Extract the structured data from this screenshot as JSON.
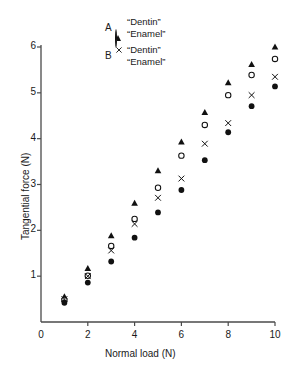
{
  "chart_data": {
    "type": "scatter",
    "title": "",
    "xlabel": "Normal load (N)",
    "ylabel": "Tangential force (N)",
    "xlim": [
      0,
      10
    ],
    "ylim": [
      0,
      6
    ],
    "xticks": [
      0,
      2,
      4,
      6,
      8,
      10
    ],
    "yticks": [
      1,
      2,
      3,
      4,
      5,
      6
    ],
    "grid": false,
    "legend_position": "top-center",
    "x": [
      1,
      2,
      3,
      4,
      5,
      6,
      7,
      8,
      9,
      10
    ],
    "series": [
      {
        "name": "A “Dentin”",
        "group": "A",
        "material": "“Dentin”",
        "marker": "filled-triangle",
        "color": "#111111",
        "values": [
          0.55,
          1.17,
          1.88,
          2.59,
          3.3,
          3.93,
          4.57,
          5.22,
          5.62,
          6.0
        ]
      },
      {
        "name": "A “Enamel”",
        "group": "A",
        "material": "“Enamel”",
        "marker": "open-circle",
        "color": "#111111",
        "values": [
          0.48,
          1.01,
          1.66,
          2.25,
          2.93,
          3.63,
          4.3,
          4.95,
          5.39,
          5.74
        ]
      },
      {
        "name": "B “Dentin”",
        "group": "B",
        "material": "“Dentin”",
        "marker": "cross-x",
        "color": "#111111",
        "values": [
          0.5,
          1.0,
          1.56,
          2.14,
          2.71,
          3.13,
          3.89,
          4.34,
          4.95,
          5.35
        ]
      },
      {
        "name": "B “Enamel”",
        "group": "B",
        "material": "“Enamel”",
        "marker": "filled-circle",
        "color": "#111111",
        "values": [
          0.42,
          0.86,
          1.32,
          1.84,
          2.39,
          2.88,
          3.53,
          4.14,
          4.71,
          5.14
        ]
      }
    ]
  },
  "legend": {
    "groups": [
      {
        "letter": "A",
        "rows": [
          {
            "marker": "filled-triangle",
            "label": "“Dentin”"
          },
          {
            "marker": "open-circle",
            "label": "“Enamel”"
          }
        ]
      },
      {
        "letter": "B",
        "rows": [
          {
            "marker": "cross-x",
            "label": "“Dentin”"
          },
          {
            "marker": "filled-circle",
            "label": "“Enamel”"
          }
        ]
      }
    ]
  },
  "axes": {
    "x_title": "Normal load (N)",
    "y_title": "Tangential force (N)",
    "x_tick_labels": [
      "0",
      "2",
      "4",
      "6",
      "8",
      "10"
    ],
    "y_tick_labels": [
      "1",
      "2",
      "3",
      "4",
      "5",
      "6"
    ]
  },
  "style": {
    "axis_color": "#4a4a4a",
    "marker_color": "#111111",
    "background": "#ffffff"
  }
}
